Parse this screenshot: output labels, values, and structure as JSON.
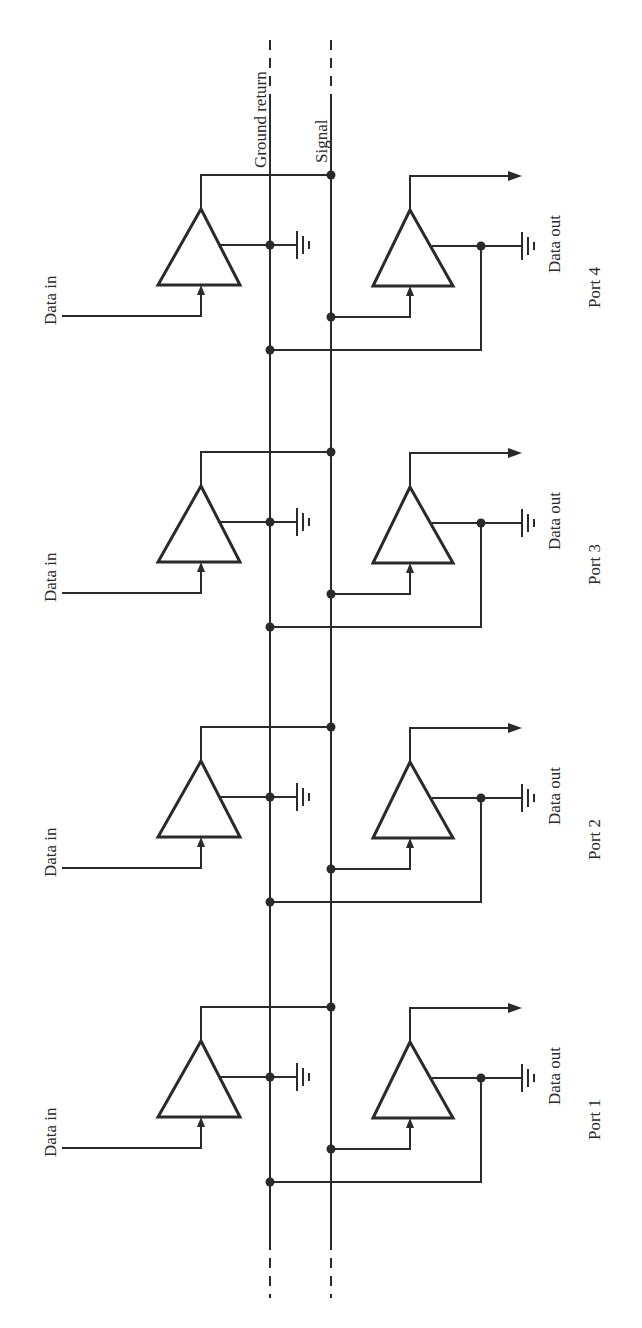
{
  "diagram": {
    "bus_labels": {
      "ground_return": "Ground return",
      "signal": "Signal"
    },
    "ports": [
      {
        "name": "Port 4",
        "input_label": "Data in",
        "output_label": "Data out",
        "y_out": 175
      },
      {
        "name": "Port 3",
        "input_label": "Data in",
        "output_label": "Data out",
        "y_out": 452
      },
      {
        "name": "Port 2",
        "input_label": "Data in",
        "output_label": "Data out",
        "y_out": 727
      },
      {
        "name": "Port 1",
        "input_label": "Data in",
        "output_label": "Data out",
        "y_out": 1007
      }
    ],
    "colors": {
      "ink": "#2a2a2a",
      "background": "#ffffff"
    }
  }
}
